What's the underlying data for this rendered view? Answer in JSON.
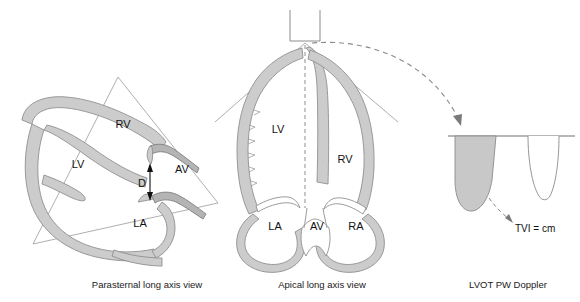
{
  "figure": {
    "background_color": "#ffffff",
    "myocardium_fill": "#cccccc",
    "outline_color": "#808080",
    "line_color": "#999999",
    "text_color": "#111111",
    "doppler_fill": "#c8c8c8"
  },
  "panels": [
    {
      "id": "parasternal",
      "caption": "Parasternal long axis view",
      "caption_x": 147,
      "caption_y": 288,
      "labels": [
        {
          "text": "RV",
          "x": 123,
          "y": 128
        },
        {
          "text": "LV",
          "x": 78,
          "y": 168
        },
        {
          "text": "AV",
          "x": 182,
          "y": 173
        },
        {
          "text": "D",
          "x": 142,
          "y": 187
        },
        {
          "text": "LA",
          "x": 140,
          "y": 227
        }
      ]
    },
    {
      "id": "apical",
      "caption": "Apical long axis view",
      "caption_x": 322,
      "caption_y": 288,
      "labels": [
        {
          "text": "LV",
          "x": 278,
          "y": 133
        },
        {
          "text": "RV",
          "x": 345,
          "y": 163
        },
        {
          "text": "LA",
          "x": 275,
          "y": 230
        },
        {
          "text": "AV",
          "x": 317,
          "y": 230
        },
        {
          "text": "RA",
          "x": 356,
          "y": 230
        }
      ]
    },
    {
      "id": "doppler",
      "caption": "LVOT PW Doppler",
      "caption_x": 508,
      "caption_y": 288,
      "labels": [
        {
          "text": "TVI = cm",
          "x": 515,
          "y": 230
        }
      ]
    }
  ],
  "icons": {
    "transducer": "transducer-icon",
    "beam_arrow": "curved-dashed-arrow-icon",
    "diameter_arrow": "double-headed-arrow-icon",
    "tvi_pointer": "dashed-pointer-arrow-icon"
  }
}
